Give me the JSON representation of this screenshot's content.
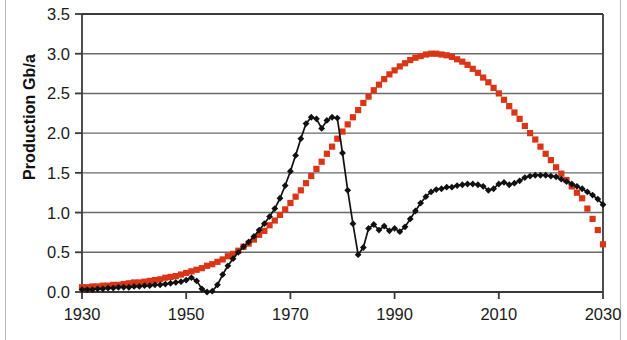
{
  "chart_data": {
    "type": "line",
    "title": "",
    "xlabel": "",
    "ylabel": "Production Gb/a",
    "xlim": [
      1930,
      2030
    ],
    "ylim": [
      0.0,
      3.5
    ],
    "grid": true,
    "grid_axis": "y",
    "legend": "none",
    "xticks": [
      "1930",
      "1950",
      "1970",
      "1990",
      "2010",
      "2030"
    ],
    "xtick_values": [
      1930,
      1950,
      1970,
      1990,
      2010,
      2030
    ],
    "yticks": [
      "0.0",
      "0.5",
      "1.0",
      "1.5",
      "2.0",
      "2.5",
      "3.0",
      "3.5"
    ],
    "ytick_values": [
      0.0,
      0.5,
      1.0,
      1.5,
      2.0,
      2.5,
      3.0,
      3.5
    ],
    "colors": {
      "series_red": "#d93517",
      "series_black": "#111111",
      "axis": "#3a3a3a",
      "grid": "#6a6a6a",
      "background": "#ffffff"
    },
    "series": [
      {
        "name": "model-curve",
        "color": "#d93517",
        "marker": "square",
        "x": [
          1930,
          1931,
          1932,
          1933,
          1934,
          1935,
          1936,
          1937,
          1938,
          1939,
          1940,
          1941,
          1942,
          1943,
          1944,
          1945,
          1946,
          1947,
          1948,
          1949,
          1950,
          1951,
          1952,
          1953,
          1954,
          1955,
          1956,
          1957,
          1958,
          1959,
          1960,
          1961,
          1962,
          1963,
          1964,
          1965,
          1966,
          1967,
          1968,
          1969,
          1970,
          1971,
          1972,
          1973,
          1974,
          1975,
          1976,
          1977,
          1978,
          1979,
          1980,
          1981,
          1982,
          1983,
          1984,
          1985,
          1986,
          1987,
          1988,
          1989,
          1990,
          1991,
          1992,
          1993,
          1994,
          1995,
          1996,
          1997,
          1998,
          1999,
          2000,
          2001,
          2002,
          2003,
          2004,
          2005,
          2006,
          2007,
          2008,
          2009,
          2010,
          2011,
          2012,
          2013,
          2014,
          2015,
          2016,
          2017,
          2018,
          2019,
          2020,
          2021,
          2022,
          2023,
          2024,
          2025,
          2026,
          2027,
          2028,
          2029,
          2030
        ],
        "y": [
          0.06,
          0.06,
          0.07,
          0.07,
          0.08,
          0.08,
          0.09,
          0.09,
          0.1,
          0.11,
          0.12,
          0.12,
          0.13,
          0.14,
          0.15,
          0.16,
          0.18,
          0.19,
          0.2,
          0.22,
          0.24,
          0.26,
          0.28,
          0.3,
          0.33,
          0.35,
          0.38,
          0.41,
          0.45,
          0.48,
          0.52,
          0.57,
          0.61,
          0.66,
          0.72,
          0.77,
          0.84,
          0.9,
          0.97,
          1.04,
          1.12,
          1.2,
          1.28,
          1.37,
          1.46,
          1.55,
          1.64,
          1.74,
          1.83,
          1.93,
          2.02,
          2.11,
          2.2,
          2.29,
          2.38,
          2.46,
          2.54,
          2.61,
          2.68,
          2.74,
          2.79,
          2.84,
          2.88,
          2.92,
          2.95,
          2.97,
          2.99,
          3.0,
          3.0,
          2.99,
          2.98,
          2.96,
          2.93,
          2.9,
          2.86,
          2.81,
          2.76,
          2.7,
          2.64,
          2.57,
          2.5,
          2.42,
          2.34,
          2.26,
          2.18,
          2.09,
          2.0,
          1.92,
          1.83,
          1.74,
          1.66,
          1.57,
          1.49,
          1.41,
          1.33,
          1.25,
          1.18,
          1.05,
          0.92,
          0.78,
          0.6
        ]
      },
      {
        "name": "historical-production",
        "color": "#111111",
        "marker": "diamond",
        "x": [
          1930,
          1931,
          1932,
          1933,
          1934,
          1935,
          1936,
          1937,
          1938,
          1939,
          1940,
          1941,
          1942,
          1943,
          1944,
          1945,
          1946,
          1947,
          1948,
          1949,
          1950,
          1951,
          1952,
          1953,
          1954,
          1955,
          1956,
          1957,
          1958,
          1959,
          1960,
          1961,
          1962,
          1963,
          1964,
          1965,
          1966,
          1967,
          1968,
          1969,
          1970,
          1971,
          1972,
          1973,
          1974,
          1975,
          1976,
          1977,
          1978,
          1979,
          1980,
          1981,
          1982,
          1983,
          1984,
          1985,
          1986,
          1987,
          1988,
          1989,
          1990,
          1991,
          1992,
          1993,
          1994,
          1995,
          1996,
          1997,
          1998,
          1999,
          2000,
          2001,
          2002,
          2003,
          2004,
          2005,
          2006,
          2007,
          2008,
          2009,
          2010,
          2011,
          2012,
          2013,
          2014,
          2015,
          2016,
          2017,
          2018,
          2019,
          2020,
          2021,
          2022,
          2023,
          2024,
          2025,
          2026,
          2027,
          2028,
          2029,
          2030
        ],
        "y": [
          0.03,
          0.03,
          0.03,
          0.04,
          0.04,
          0.05,
          0.05,
          0.06,
          0.06,
          0.06,
          0.07,
          0.07,
          0.08,
          0.08,
          0.09,
          0.09,
          0.1,
          0.11,
          0.12,
          0.13,
          0.15,
          0.18,
          0.14,
          0.04,
          0.0,
          0.01,
          0.09,
          0.22,
          0.33,
          0.42,
          0.5,
          0.57,
          0.63,
          0.7,
          0.78,
          0.86,
          0.95,
          1.05,
          1.18,
          1.34,
          1.52,
          1.72,
          1.93,
          2.12,
          2.2,
          2.18,
          2.06,
          2.16,
          2.2,
          2.19,
          1.75,
          1.28,
          0.86,
          0.47,
          0.56,
          0.8,
          0.85,
          0.78,
          0.83,
          0.77,
          0.8,
          0.76,
          0.82,
          0.92,
          1.02,
          1.12,
          1.2,
          1.26,
          1.29,
          1.3,
          1.32,
          1.32,
          1.34,
          1.35,
          1.36,
          1.36,
          1.35,
          1.33,
          1.28,
          1.3,
          1.36,
          1.38,
          1.35,
          1.37,
          1.4,
          1.44,
          1.46,
          1.47,
          1.47,
          1.47,
          1.46,
          1.45,
          1.42,
          1.39,
          1.36,
          1.33,
          1.3,
          1.26,
          1.22,
          1.17,
          1.1
        ]
      }
    ]
  }
}
